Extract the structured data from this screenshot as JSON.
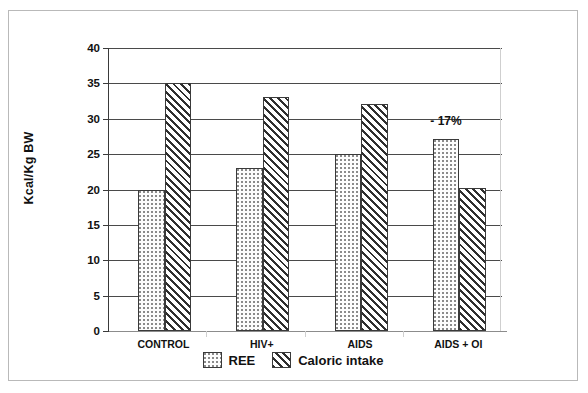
{
  "chart_data": {
    "type": "bar",
    "title": "",
    "xlabel": "",
    "ylabel": "Kcal/Kg BW",
    "ylim": [
      0,
      40
    ],
    "yticks": [
      0,
      5,
      10,
      15,
      20,
      25,
      30,
      35,
      40
    ],
    "ytick_labels": [
      "0",
      "5",
      "10",
      "15",
      "20",
      "25",
      "30",
      "35",
      "40"
    ],
    "grid": "horizontal",
    "legend_position": "bottom-center",
    "categories": [
      "CONTROL",
      "HIV+",
      "AIDS",
      "AIDS + OI"
    ],
    "series": [
      {
        "name": "REE",
        "pattern": "dotted",
        "values": [
          20,
          23,
          25,
          27.2
        ]
      },
      {
        "name": "Caloric intake",
        "pattern": "diagonal-hatch",
        "values": [
          35,
          33.1,
          32.1,
          20.2
        ]
      }
    ],
    "annotations": [
      {
        "text": "- 17%",
        "category": "AIDS + OI",
        "series": "REE",
        "value": 29.6
      }
    ],
    "colors": {
      "axis": "#3a3a3a",
      "gridline": "#4a4a4a",
      "bar_outline": "#3a3a3a",
      "dot_pattern": "#8b8b8b",
      "hatch_pattern": "#2f2f2f",
      "frame_border": "#b9b9b9",
      "background": "#ffffff"
    }
  }
}
